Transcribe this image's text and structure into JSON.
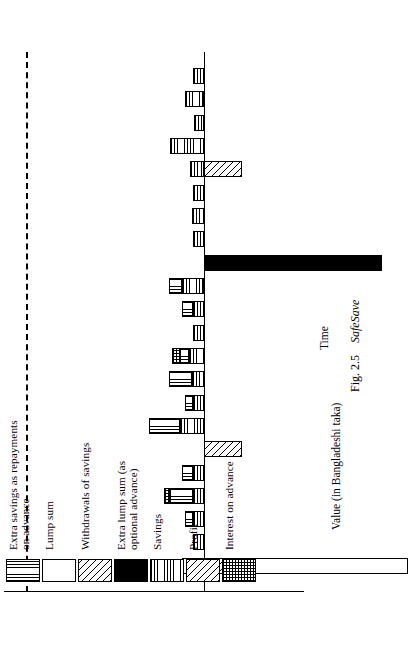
{
  "figure": {
    "caption_number": "Fig. 2.5",
    "caption_name": "SafeSave",
    "x_axis_title": "Time",
    "y_axis_title": "Value (in Bangladeshi taka)"
  },
  "legend": {
    "items": [
      {
        "label": "Extra savings as repayments\non advance",
        "pattern": "vertical-lines",
        "key": "extra_savings_repayments"
      },
      {
        "label": "Lump sum",
        "pattern": "white",
        "key": "lump_sum"
      },
      {
        "label": "Withdrawals of savings",
        "pattern": "diagonal-hatch",
        "key": "withdrawals_of_savings"
      },
      {
        "label": "Extra lump sum (as\noptional advance)",
        "pattern": "solid-black",
        "key": "extra_lump_sum"
      },
      {
        "label": "Savings",
        "pattern": "horizontal-lines",
        "key": "savings"
      },
      {
        "label": "Profit",
        "pattern": "diagonal-hatch",
        "key": "profit"
      },
      {
        "label": "Interest on advance",
        "pattern": "crosshatch",
        "key": "interest_on_advance"
      }
    ]
  },
  "chart_data": {
    "type": "bar",
    "title": "",
    "xlabel": "Time",
    "ylabel": "Value (in Bangladeshi taka)",
    "orientation": "vertical-stacked-diverging",
    "grid": false,
    "legend_position": "upper-left",
    "axis_tick_labels": [],
    "reference_line": {
      "label": "advance ceiling",
      "style": "dashed",
      "value": -1000
    },
    "ylim": [
      -1050,
      420
    ],
    "note": "Stacked bars over time; positive values above the zero line, negative (withdrawals / lump sums paid out) below it.",
    "series_keys": [
      "savings",
      "extra_savings_repayments",
      "interest_on_advance",
      "profit",
      "lump_sum",
      "withdrawals_of_savings",
      "extra_lump_sum"
    ],
    "bars": [
      {
        "t": 1,
        "segments": [
          {
            "key": "withdrawals_of_savings",
            "value": -215
          },
          {
            "key": "lump_sum",
            "value": -785
          },
          {
            "key": "savings",
            "value": 110
          }
        ]
      },
      {
        "t": 2,
        "segments": [
          {
            "key": "savings",
            "value": 55
          }
        ]
      },
      {
        "t": 3,
        "segments": [
          {
            "key": "savings",
            "value": 55
          },
          {
            "key": "extra_savings_repayments",
            "value": 40
          }
        ]
      },
      {
        "t": 4,
        "segments": [
          {
            "key": "savings",
            "value": 55
          },
          {
            "key": "extra_savings_repayments",
            "value": 110
          },
          {
            "key": "interest_on_advance",
            "value": 30
          }
        ]
      },
      {
        "t": 5,
        "segments": [
          {
            "key": "savings",
            "value": 55
          },
          {
            "key": "extra_savings_repayments",
            "value": 55
          }
        ]
      },
      {
        "t": 6,
        "segments": [
          {
            "key": "withdrawals_of_savings",
            "value": -185
          }
        ]
      },
      {
        "t": 7,
        "segments": [
          {
            "key": "savings",
            "value": 120
          },
          {
            "key": "extra_savings_repayments",
            "value": 150
          }
        ]
      },
      {
        "t": 8,
        "segments": [
          {
            "key": "savings",
            "value": 55
          },
          {
            "key": "extra_savings_repayments",
            "value": 40
          }
        ]
      },
      {
        "t": 9,
        "segments": [
          {
            "key": "savings",
            "value": 60
          },
          {
            "key": "extra_savings_repayments",
            "value": 110
          }
        ]
      },
      {
        "t": 10,
        "segments": [
          {
            "key": "savings",
            "value": 75
          },
          {
            "key": "extra_savings_repayments",
            "value": 45
          },
          {
            "key": "interest_on_advance",
            "value": 35
          }
        ]
      },
      {
        "t": 11,
        "segments": [
          {
            "key": "savings",
            "value": 55
          }
        ]
      },
      {
        "t": 12,
        "segments": [
          {
            "key": "savings",
            "value": 55
          },
          {
            "key": "extra_savings_repayments",
            "value": 55
          }
        ]
      },
      {
        "t": 13,
        "segments": [
          {
            "key": "savings",
            "value": 110
          },
          {
            "key": "extra_savings_repayments",
            "value": 60
          }
        ]
      },
      {
        "t": 14,
        "segments": [
          {
            "key": "extra_lump_sum",
            "value": -870
          }
        ]
      },
      {
        "t": 15,
        "segments": [
          {
            "key": "savings",
            "value": 55
          }
        ]
      },
      {
        "t": 16,
        "segments": [
          {
            "key": "savings",
            "value": 60
          }
        ]
      },
      {
        "t": 17,
        "segments": [
          {
            "key": "savings",
            "value": 55
          }
        ]
      },
      {
        "t": 18,
        "segments": [
          {
            "key": "savings",
            "value": 70
          },
          {
            "key": "profit",
            "value": -185
          }
        ]
      },
      {
        "t": 19,
        "segments": [
          {
            "key": "savings",
            "value": 165
          }
        ]
      },
      {
        "t": 20,
        "segments": [
          {
            "key": "savings",
            "value": 50
          }
        ]
      },
      {
        "t": 21,
        "segments": [
          {
            "key": "savings",
            "value": 95
          }
        ]
      },
      {
        "t": 22,
        "segments": [
          {
            "key": "savings",
            "value": 55
          }
        ]
      }
    ]
  }
}
